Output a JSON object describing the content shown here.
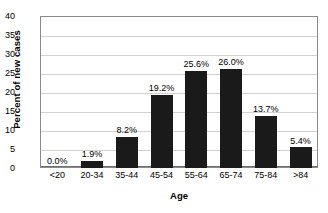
{
  "chart_data": {
    "type": "bar",
    "title": "",
    "xlabel": "Age",
    "ylabel": "Percent of new cases",
    "categories": [
      "<20",
      "20-34",
      "35-44",
      "45-54",
      "55-64",
      "65-74",
      "75-84",
      ">84"
    ],
    "values": [
      0.0,
      1.9,
      8.2,
      19.2,
      25.6,
      26.0,
      13.7,
      5.4
    ],
    "data_labels": [
      "0.0%",
      "1.9%",
      "8.2%",
      "19.2%",
      "25.6%",
      "26.0%",
      "13.7%",
      "5.4%"
    ],
    "ylim": [
      0,
      40
    ],
    "ytick_step": 5,
    "yticks": [
      40,
      35,
      30,
      25,
      20,
      15,
      10,
      5,
      0
    ],
    "ytick_labels": [
      "40",
      "35",
      "30",
      "25",
      "20",
      "15",
      "10",
      "5",
      "0"
    ],
    "grid": true,
    "grid_axis": "y",
    "legend": false,
    "legend_position": "none",
    "bar_color": "#1a1a1a",
    "grid_color": "#d2d2d2",
    "frame_color": "#8a8a8a",
    "background_color": "#ffffff",
    "text_color": "#000000"
  }
}
